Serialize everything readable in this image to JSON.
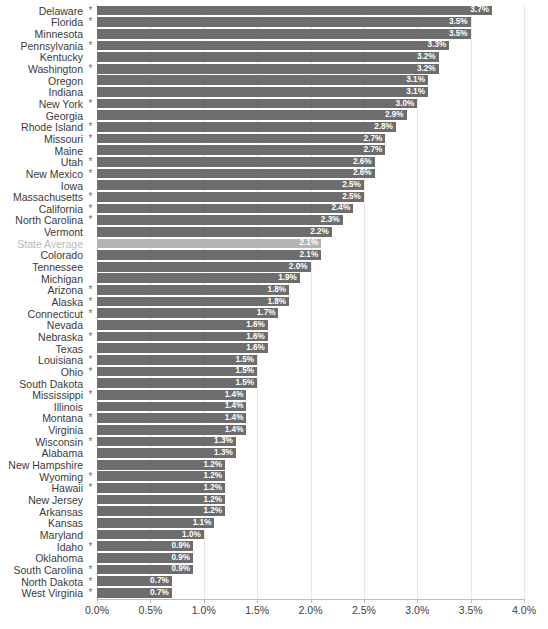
{
  "chart_data": {
    "type": "bar",
    "orientation": "horizontal",
    "title": "",
    "subtitle": "",
    "xlabel": "",
    "ylabel": "",
    "xlim": [
      0,
      4.0
    ],
    "xtick_labels": [
      "0.0%",
      "0.5%",
      "1.0%",
      "1.5%",
      "2.0%",
      "2.5%",
      "3.0%",
      "3.5%",
      "4.0%"
    ],
    "xtick_values": [
      0,
      0.5,
      1.0,
      1.5,
      2.0,
      2.5,
      3.0,
      3.5,
      4.0
    ],
    "grid": true,
    "grid_axis": "x",
    "legend": "none",
    "value_label_format": "0.0%",
    "marker_symbol": "*",
    "colors": {
      "bar": "#6d6d6d",
      "bar_highlight": "#b4b4b4",
      "value_text": "#ffffff",
      "category_text": "#3a3a3a",
      "category_text_highlight": "#b9b9b9",
      "gridline": "#e8e8e8",
      "axis": "#bfbfbf",
      "background": "#ffffff"
    },
    "categories": [
      "Delaware",
      "Florida",
      "Minnesota",
      "Pennsylvania",
      "Kentucky",
      "Washington",
      "Oregon",
      "Indiana",
      "New York",
      "Georgia",
      "Rhode Island",
      "Missouri",
      "Maine",
      "Utah",
      "New Mexico",
      "Iowa",
      "Massachusetts",
      "California",
      "North Carolina",
      "Vermont",
      "State Average",
      "Colorado",
      "Tennessee",
      "Michigan",
      "Arizona",
      "Alaska",
      "Connecticut",
      "Nevada",
      "Nebraska",
      "Texas",
      "Louisiana",
      "Ohio",
      "South Dakota",
      "Mississippi",
      "Illinois",
      "Montana",
      "Virginia",
      "Wisconsin",
      "Alabama",
      "New Hampshire",
      "Wyoming",
      "Hawaii",
      "New Jersey",
      "Arkansas",
      "Kansas",
      "Maryland",
      "Idaho",
      "Oklahoma",
      "South Carolina",
      "North Dakota",
      "West Virginia"
    ],
    "values": [
      3.7,
      3.5,
      3.5,
      3.3,
      3.2,
      3.2,
      3.1,
      3.1,
      3.0,
      2.9,
      2.8,
      2.7,
      2.7,
      2.6,
      2.6,
      2.5,
      2.5,
      2.4,
      2.3,
      2.2,
      2.1,
      2.1,
      2.0,
      1.9,
      1.8,
      1.8,
      1.7,
      1.6,
      1.6,
      1.6,
      1.5,
      1.5,
      1.5,
      1.4,
      1.4,
      1.4,
      1.4,
      1.3,
      1.3,
      1.2,
      1.2,
      1.2,
      1.2,
      1.2,
      1.1,
      1.0,
      0.9,
      0.9,
      0.9,
      0.7,
      0.7
    ],
    "value_labels": [
      "3.7%",
      "3.5%",
      "3.5%",
      "3.3%",
      "3.2%",
      "3.2%",
      "3.1%",
      "3.1%",
      "3.0%",
      "2.9%",
      "2.8%",
      "2.7%",
      "2.7%",
      "2.6%",
      "2.6%",
      "2.5%",
      "2.5%",
      "2.4%",
      "2.3%",
      "2.2%",
      "2.1%",
      "2.1%",
      "2.0%",
      "1.9%",
      "1.8%",
      "1.8%",
      "1.7%",
      "1.6%",
      "1.6%",
      "1.6%",
      "1.5%",
      "1.5%",
      "1.5%",
      "1.4%",
      "1.4%",
      "1.4%",
      "1.4%",
      "1.3%",
      "1.3%",
      "1.2%",
      "1.2%",
      "1.2%",
      "1.2%",
      "1.2%",
      "1.1%",
      "1.0%",
      "0.9%",
      "0.9%",
      "0.9%",
      "0.7%",
      "0.7%"
    ],
    "starred": [
      true,
      true,
      false,
      true,
      false,
      true,
      false,
      false,
      true,
      false,
      true,
      true,
      false,
      true,
      true,
      false,
      true,
      true,
      true,
      false,
      false,
      false,
      false,
      false,
      true,
      true,
      true,
      false,
      true,
      false,
      true,
      true,
      false,
      true,
      false,
      true,
      false,
      true,
      false,
      false,
      true,
      true,
      false,
      false,
      false,
      false,
      true,
      false,
      true,
      true,
      true
    ],
    "highlight_index": 20
  }
}
